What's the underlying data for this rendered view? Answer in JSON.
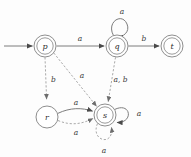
{
  "diagram": {
    "kind": "state-transition-diagram",
    "colors": {
      "background": "#fdfdfd",
      "state_stroke": "#8e8e8e",
      "solid_edge": "#7d7d7d",
      "dashed_edge": "#9a9a9a",
      "label_text": "#2b2b2b"
    },
    "states": [
      {
        "id": "p",
        "label": "p",
        "cx": 45,
        "cy": 46,
        "r_outer": 11,
        "r_inner": 8.2,
        "accepting": true,
        "initial": true
      },
      {
        "id": "q",
        "label": "q",
        "cx": 117,
        "cy": 46,
        "r_outer": 11,
        "r_inner": 8.2,
        "accepting": true,
        "initial": false
      },
      {
        "id": "t",
        "label": "t",
        "cx": 172,
        "cy": 46,
        "r_outer": 11,
        "r_inner": 8.2,
        "accepting": true,
        "initial": false
      },
      {
        "id": "r",
        "label": "r",
        "cx": 47,
        "cy": 117,
        "r_outer": 11,
        "r_inner": 0,
        "accepting": false,
        "initial": false
      },
      {
        "id": "s",
        "label": "s",
        "cx": 105,
        "cy": 115,
        "r_outer": 11,
        "r_inner": 8.2,
        "accepting": true,
        "initial": false
      }
    ],
    "transitions": [
      {
        "id": "start-p",
        "from": "",
        "to": "p",
        "label": "",
        "style": "solid"
      },
      {
        "id": "p-q",
        "from": "p",
        "to": "q",
        "label": "a",
        "style": "solid"
      },
      {
        "id": "q-q",
        "from": "q",
        "to": "q",
        "label": "a",
        "style": "solid"
      },
      {
        "id": "q-t",
        "from": "q",
        "to": "t",
        "label": "b",
        "style": "solid"
      },
      {
        "id": "r-s",
        "from": "r",
        "to": "s",
        "label": "a",
        "style": "solid"
      },
      {
        "id": "s-s",
        "from": "s",
        "to": "s",
        "label": "a",
        "style": "solid"
      },
      {
        "id": "p-r",
        "from": "p",
        "to": "r",
        "label": "b",
        "style": "dashed"
      },
      {
        "id": "p-s",
        "from": "p",
        "to": "s",
        "label": "a",
        "style": "dashed"
      },
      {
        "id": "q-s",
        "from": "q",
        "to": "s",
        "label": "a, b",
        "style": "dashed"
      },
      {
        "id": "r-s-alt",
        "from": "r",
        "to": "s",
        "label": "a",
        "style": "dashed"
      },
      {
        "id": "s-s-alt",
        "from": "s",
        "to": "s",
        "label": "a",
        "style": "dashed"
      }
    ],
    "labels": {
      "q_self_a": "a",
      "p_q_a": "a",
      "q_t_b": "b",
      "p_r_b": "b",
      "p_s_a": "a",
      "q_s_ab": "a, b",
      "r_s_a_top": "a",
      "r_s_a_bottom": "a",
      "s_self_a_right": "a",
      "s_self_a_bottom": "a"
    },
    "state_labels": {
      "p": "p",
      "q": "q",
      "t": "t",
      "r": "r",
      "s": "s"
    }
  }
}
